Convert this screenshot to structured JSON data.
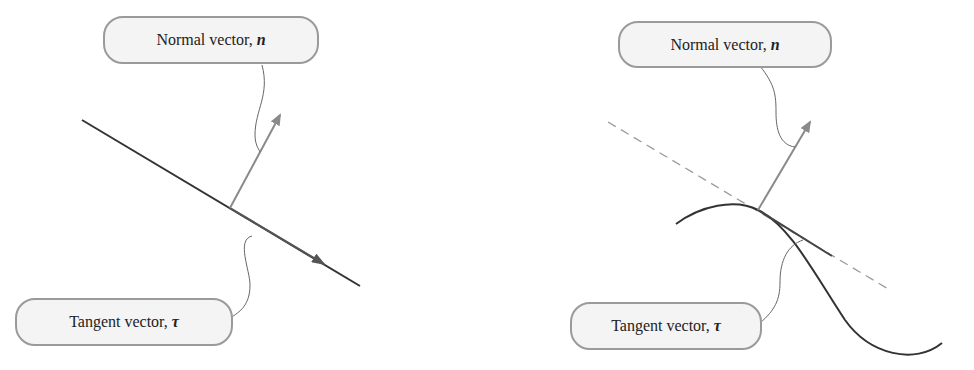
{
  "panels": [
    {
      "id": "left",
      "description": "Straight line with normal and tangent vectors",
      "normal_label": {
        "text": "Normal vector,",
        "symbol": "n"
      },
      "tangent_label": {
        "text": "Tangent vector,",
        "symbol": "τ"
      }
    },
    {
      "id": "right",
      "description": "Curve with tangent line (dashed) and normal/tangent vectors",
      "normal_label": {
        "text": "Normal vector,",
        "symbol": "n"
      },
      "tangent_label": {
        "text": "Tangent vector,",
        "symbol": "τ"
      }
    }
  ],
  "colors": {
    "curve": "#333333",
    "vector": "#8a8a8a",
    "leader": "#666666",
    "dashed": "#9a9a9a",
    "label_border": "#9a9a9a",
    "label_fill": "#f4f4f4"
  }
}
